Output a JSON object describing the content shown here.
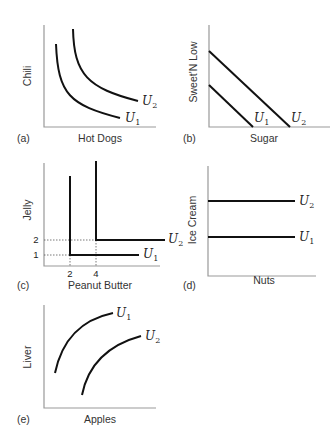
{
  "panels": [
    {
      "id": "a",
      "tag": "(a)",
      "xlabel": "Hot Dogs",
      "ylabel": "Chili",
      "curves": [
        "U1",
        "U2"
      ],
      "type": "convex indifference curves"
    },
    {
      "id": "b",
      "tag": "(b)",
      "xlabel": "Sugar",
      "ylabel": "Sweet'N Low",
      "curves": [
        "U1",
        "U2"
      ],
      "type": "perfect substitutes (linear)"
    },
    {
      "id": "c",
      "tag": "(c)",
      "xlabel": "Peanut Butter",
      "ylabel": "Jelly",
      "curves": [
        "U1",
        "U2"
      ],
      "type": "perfect complements (L-shaped)",
      "x_ticks": [
        "2",
        "4"
      ],
      "y_ticks": [
        "1",
        "2"
      ]
    },
    {
      "id": "d",
      "tag": "(d)",
      "xlabel": "Nuts",
      "ylabel": "Ice Cream",
      "curves": [
        "U2",
        "U1"
      ],
      "type": "horizontal (neutral good)"
    },
    {
      "id": "e",
      "tag": "(e)",
      "xlabel": "Apples",
      "ylabel": "Liver",
      "curves": [
        "U1",
        "U2"
      ],
      "type": "upward sloping (bad)"
    }
  ],
  "labels": {
    "U": "U",
    "sub1": "1",
    "sub2": "2"
  }
}
